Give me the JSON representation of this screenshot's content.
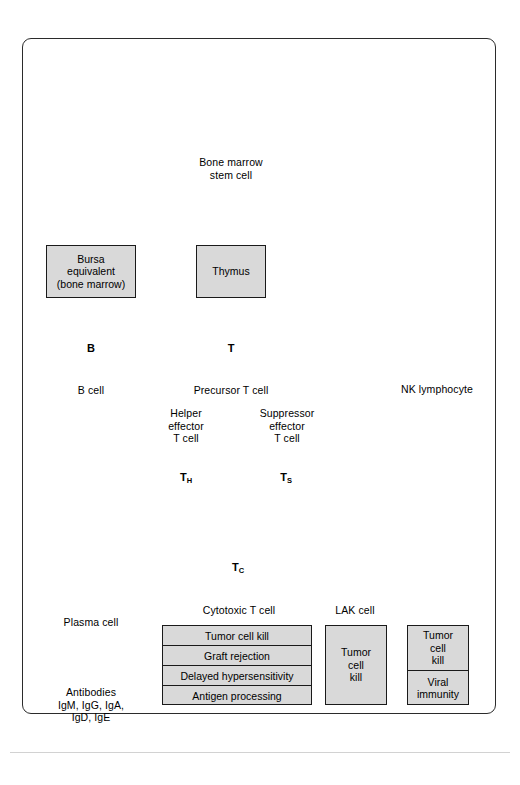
{
  "diagram": {
    "colors": {
      "cell_nucleus": "#808080",
      "cell_cytoplasm": "#ececec",
      "box_fill": "#d9d9d9",
      "stroke": "#1a1a1a",
      "frame": "#2b2b2b",
      "connector": "#6e6e6e",
      "antibody": "#111111"
    },
    "origin": {
      "bone_icon_name": "bone-marrow-bone-icon",
      "stem_cell_label": "Bone marrow\nstem cell",
      "stem_cell_glyph": ""
    },
    "organs": [
      {
        "id": "bursa",
        "label": "Bursa\nequivalent\n(bone marrow)"
      },
      {
        "id": "thymus",
        "label": "Thymus"
      }
    ],
    "cells": [
      {
        "id": "stem",
        "glyph": "",
        "label": "Bone marrow\nstem cell",
        "type": "plain"
      },
      {
        "id": "bcell",
        "glyph": "B",
        "label": "B cell",
        "type": "plain"
      },
      {
        "id": "tcell",
        "glyph": "T",
        "label": "Precursor T cell",
        "type": "plain"
      },
      {
        "id": "nk",
        "glyph": "",
        "label": "NK lymphocyte",
        "type": "granular"
      },
      {
        "id": "th",
        "glyph": "TH",
        "glyph_base": "T",
        "glyph_sub": "H",
        "label": "Helper\neffector\nT cell",
        "type": "plain"
      },
      {
        "id": "ts",
        "glyph": "TS",
        "glyph_base": "T",
        "glyph_sub": "S",
        "label": "Suppressor\neffector\nT cell",
        "type": "plain"
      },
      {
        "id": "tc",
        "glyph": "TC",
        "glyph_base": "T",
        "glyph_sub": "C",
        "label": "Cytotoxic T cell",
        "type": "plain"
      },
      {
        "id": "lak",
        "glyph": "",
        "label": "LAK cell",
        "type": "granular"
      },
      {
        "id": "plasma",
        "glyph": "",
        "label": "Plasma cell",
        "type": "ellipse"
      }
    ],
    "antibodies": {
      "icon_count": 3,
      "icon_name": "antibody-y-icon",
      "label": "Antibodies\nIgM, IgG, IgA,\nIgD, IgE"
    },
    "function_boxes": {
      "t_cell_functions": [
        "Tumor cell kill",
        "Graft rejection",
        "Delayed hypersensitivity",
        "Antigen processing"
      ],
      "lak_functions": [
        "Tumor\ncell\nkill"
      ],
      "nk_functions": [
        "Tumor\ncell\nkill",
        "Viral\nimmunity"
      ]
    }
  }
}
